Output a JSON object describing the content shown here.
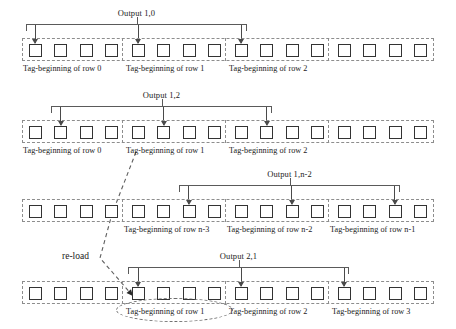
{
  "diagram": {
    "geometry": {
      "tape_left": 22,
      "tape_width": 412,
      "groups": 4,
      "cells_per_group": 4,
      "cell_pitch": 25.3,
      "group_pitch": 103
    },
    "rows": [
      {
        "id": "row-1",
        "output_label": "Output 1,0",
        "tape_top": 38,
        "bracket_top": 24,
        "label_top": 8,
        "bracket_left": 26,
        "bracket_right": 247,
        "arrow_cells": [
          0,
          4,
          8
        ],
        "tags": [
          {
            "text": "Tag-beginning of row 0",
            "left": 23
          },
          {
            "text": "Tag-beginning of row 1",
            "left": 126
          },
          {
            "text": "Tag-beginning of row 2",
            "left": 229
          }
        ],
        "tag_top": 64
      },
      {
        "id": "row-2",
        "output_label": "Output 1,2",
        "tape_top": 120,
        "bracket_top": 106,
        "label_top": 90,
        "bracket_left": 51,
        "bracket_right": 272,
        "arrow_cells": [
          1,
          5,
          9
        ],
        "tags": [
          {
            "text": "Tag-beginning of row 0",
            "left": 23
          },
          {
            "text": "Tag-beginning of row 1",
            "left": 126
          },
          {
            "text": "Tag-beginning of row 2",
            "left": 229
          }
        ],
        "tag_top": 146
      },
      {
        "id": "row-3",
        "output_label": "Output 1,n-2",
        "tape_top": 199,
        "bracket_top": 185,
        "label_top": 169,
        "bracket_left": 179,
        "bracket_right": 400,
        "arrow_cells": [
          6,
          10,
          14
        ],
        "tags": [
          {
            "text": "Tag-beginning of row n-3",
            "left": 124
          },
          {
            "text": "Tag-beginning of row n-2",
            "left": 227
          },
          {
            "text": "Tag-beginning of row n-1",
            "left": 330
          }
        ],
        "tag_top": 225
      },
      {
        "id": "row-4",
        "output_label": "Output 2,1",
        "tape_top": 281,
        "bracket_top": 267,
        "label_top": 251,
        "bracket_left": 128,
        "bracket_right": 349,
        "arrow_cells": [
          4,
          8,
          12
        ],
        "tags": [
          {
            "text": "Tag-beginning of row 1",
            "left": 126
          },
          {
            "text": "Tag-beginning of row 2",
            "left": 229
          },
          {
            "text": "Tag-beginning of row 3",
            "left": 332
          }
        ],
        "tag_top": 307
      }
    ],
    "annotations": {
      "reload_label": "re-load",
      "reload_label_left": 62,
      "reload_label_top": 251,
      "highlight_ellipse": {
        "left": 116,
        "top": 298,
        "width": 117,
        "height": 24
      },
      "connector_path": "M 136,152 L 112,214 L 100,258 L 133,296"
    },
    "colors": {
      "cell_stroke": "#333333",
      "tape_stroke": "#8d8d8d",
      "bracket_stroke": "#5a5a5a",
      "arrow_stroke": "#4a4a4a",
      "text": "#1a1a1a",
      "background": "#ffffff"
    }
  }
}
